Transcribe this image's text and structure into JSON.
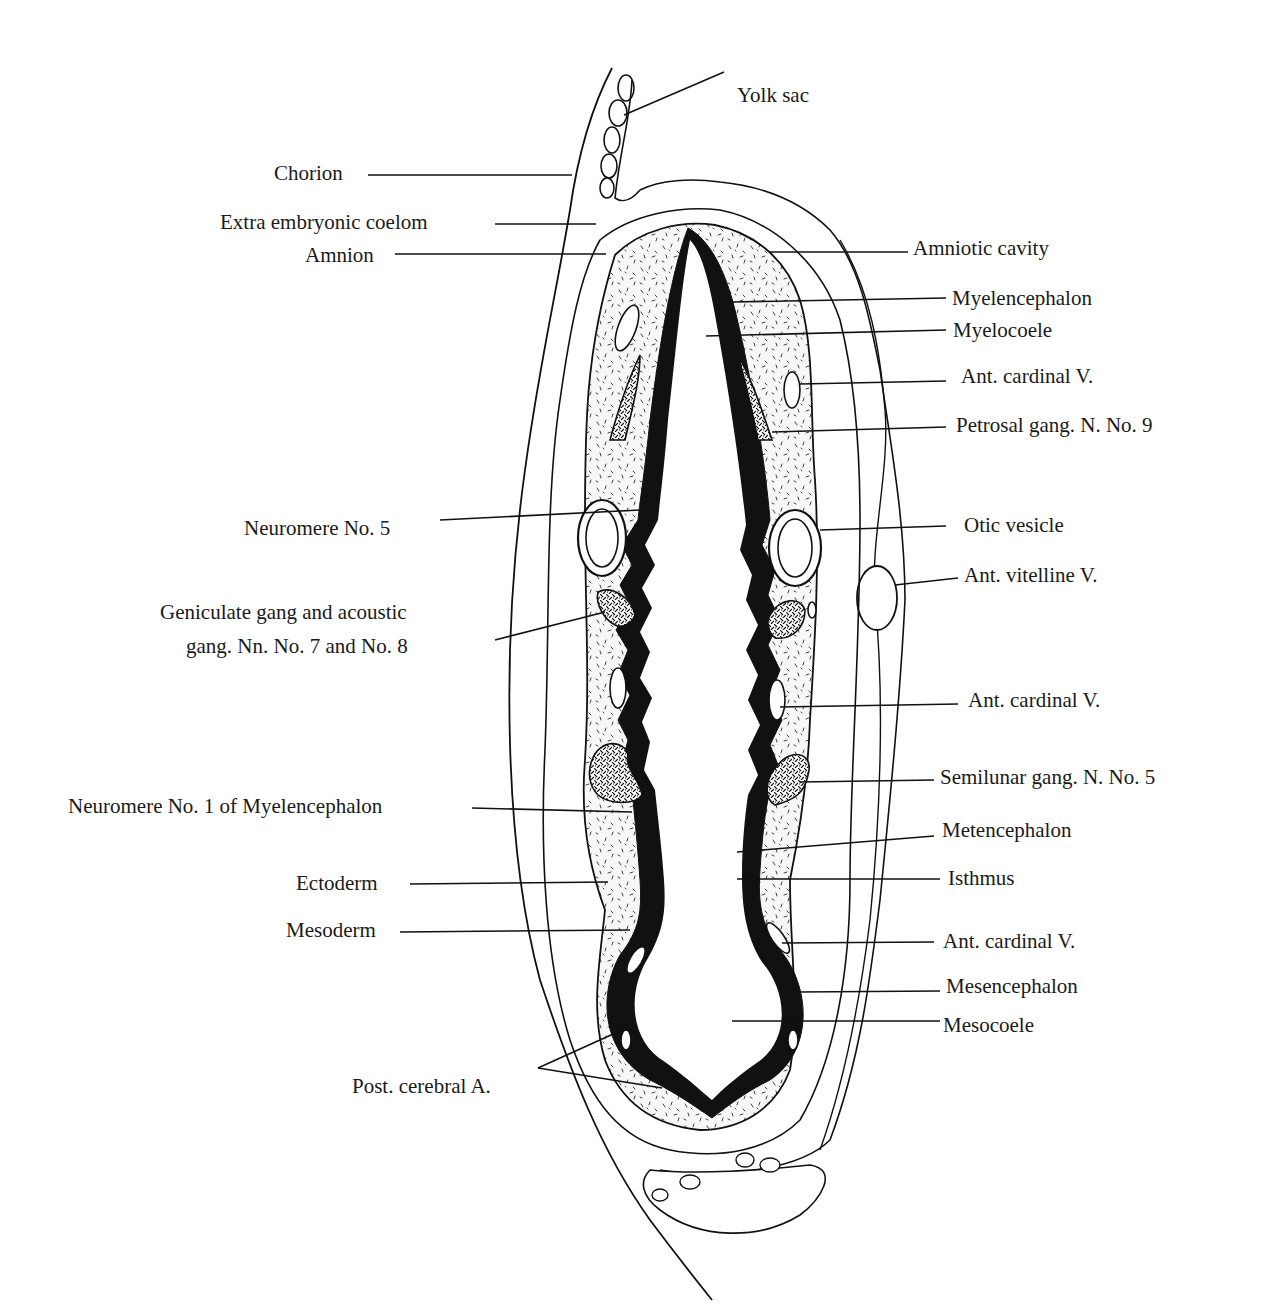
{
  "figure": {
    "colors": {
      "ink": "#111111",
      "paper": "#ffffff",
      "stipple": "#333333"
    }
  },
  "labels_left": [
    {
      "id": "chorion",
      "text": "Chorion",
      "x": 274,
      "y": 163
    },
    {
      "id": "extra-embryonic-coelom",
      "text": "Extra embryonic coelom",
      "x": 220,
      "y": 212
    },
    {
      "id": "amnion",
      "text": "Amnion",
      "x": 305,
      "y": 245
    },
    {
      "id": "neuromere-5",
      "text": "Neuromere No. 5",
      "x": 244,
      "y": 518
    },
    {
      "id": "geniculate-gang-line1",
      "text": "Geniculate gang and acoustic",
      "x": 160,
      "y": 602
    },
    {
      "id": "geniculate-gang-line2",
      "text": "gang. Nn. No. 7 and No. 8",
      "x": 186,
      "y": 636
    },
    {
      "id": "neuromere-1",
      "text": "Neuromere No. 1 of Myelencephalon",
      "x": 68,
      "y": 796
    },
    {
      "id": "ectoderm",
      "text": "Ectoderm",
      "x": 296,
      "y": 873
    },
    {
      "id": "mesoderm",
      "text": "Mesoderm",
      "x": 286,
      "y": 920
    },
    {
      "id": "post-cerebral-a",
      "text": "Post. cerebral A.",
      "x": 352,
      "y": 1076
    }
  ],
  "labels_right": [
    {
      "id": "yolk-sac",
      "text": "Yolk sac",
      "x": 737,
      "y": 85
    },
    {
      "id": "amniotic-cavity",
      "text": "Amniotic cavity",
      "x": 913,
      "y": 238
    },
    {
      "id": "myelencephalon",
      "text": "Myelencephalon",
      "x": 952,
      "y": 288
    },
    {
      "id": "myelocoele",
      "text": "Myelocoele",
      "x": 953,
      "y": 320
    },
    {
      "id": "ant-cardinal-v-1",
      "text": "Ant. cardinal V.",
      "x": 961,
      "y": 366
    },
    {
      "id": "petrosal-gang",
      "text": "Petrosal gang. N. No. 9",
      "x": 956,
      "y": 415
    },
    {
      "id": "otic-vesicle",
      "text": "Otic vesicle",
      "x": 964,
      "y": 515
    },
    {
      "id": "ant-vitelline-v",
      "text": "Ant. vitelline V.",
      "x": 964,
      "y": 565
    },
    {
      "id": "ant-cardinal-v-2",
      "text": "Ant. cardinal V.",
      "x": 968,
      "y": 690
    },
    {
      "id": "semilunar-gang",
      "text": "Semilunar gang. N. No. 5",
      "x": 940,
      "y": 767
    },
    {
      "id": "metencephalon",
      "text": "Metencephalon",
      "x": 942,
      "y": 820
    },
    {
      "id": "isthmus",
      "text": "Isthmus",
      "x": 948,
      "y": 868
    },
    {
      "id": "ant-cardinal-v-3",
      "text": "Ant. cardinal V.",
      "x": 943,
      "y": 931
    },
    {
      "id": "mesencephalon",
      "text": "Mesencephalon",
      "x": 946,
      "y": 976
    },
    {
      "id": "mesocoele",
      "text": "Mesocoele",
      "x": 943,
      "y": 1015
    }
  ]
}
